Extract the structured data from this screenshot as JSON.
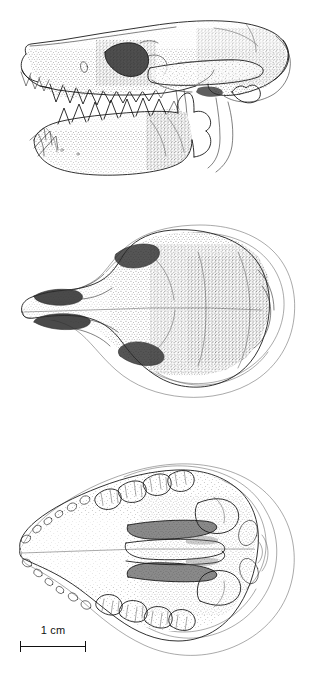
{
  "figure": {
    "type": "scientific-line-drawing",
    "background_color": "#ffffff",
    "ink_color": "#1a1a1a",
    "technique": "pen-and-ink stipple shading",
    "panel_count": 3
  },
  "panels": [
    {
      "id": "lateral",
      "name": "lateral-view",
      "caption": "",
      "description": "Skull in left lateral view with mandible articulated, showing incisors, canine, premolars and molars",
      "features": [
        "premaxilla",
        "nasal",
        "maxilla",
        "infraorbital foramen",
        "orbit",
        "zygomatic arch",
        "braincase",
        "occipital condyle",
        "mandible",
        "coronoid process",
        "angular process"
      ]
    },
    {
      "id": "dorsal",
      "name": "dorsal-view",
      "caption": "",
      "description": "Skull in dorsal view showing nasals, frontals, parietals and the outline of the zygomatic arches",
      "features": [
        "nasals",
        "premaxillae",
        "frontals",
        "postorbital constriction",
        "parietals",
        "sagittal suture",
        "zygomatic arch outline",
        "occipital region"
      ]
    },
    {
      "id": "ventral",
      "name": "ventral-view",
      "caption": "",
      "description": "Skull in ventral view showing the complete upper tooth rows, palatal vacuities, basicranium and auditory bullae",
      "features": [
        "incisors",
        "canine",
        "premolars",
        "molars",
        "palatine vacuities",
        "pterygoid region",
        "auditory region",
        "foramen magnum",
        "occipital condyles"
      ]
    }
  ],
  "scale_bar": {
    "label": "1 cm",
    "value": 1,
    "unit": "cm",
    "length_px": 66,
    "color": "#111111",
    "position": "bottom-left"
  }
}
